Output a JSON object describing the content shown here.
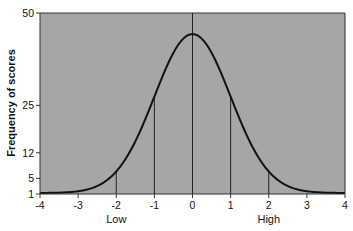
{
  "chart_data": {
    "type": "line",
    "title": "",
    "xlabel": "",
    "ylabel": "Frequency of scores",
    "xlim": [
      -4,
      4
    ],
    "ylim": [
      1,
      50
    ],
    "x_ticks": [
      -4,
      -3,
      -2,
      -1,
      0,
      1,
      2,
      3,
      4
    ],
    "y_ticks": [
      1,
      5,
      12,
      25,
      50
    ],
    "x_annotations": [
      {
        "x": -2,
        "label": "Low"
      },
      {
        "x": 2,
        "label": "High"
      }
    ],
    "vertical_lines": [
      -2,
      -1,
      0,
      1,
      2
    ],
    "grid": false,
    "legend": null,
    "background": "#a6a6a6",
    "line_color": "#111111",
    "series": [
      {
        "name": "Normal distribution",
        "x": [
          -4,
          -3.5,
          -3,
          -2.5,
          -2,
          -1.5,
          -1,
          -0.5,
          0,
          0.5,
          1,
          1.5,
          2,
          2.5,
          3,
          3.5,
          4
        ],
        "values": [
          1.0,
          1.1,
          1.5,
          2.9,
          6.9,
          14.1,
          27.4,
          39.4,
          44.5,
          39.4,
          27.4,
          14.1,
          6.9,
          2.9,
          1.5,
          1.1,
          1.0
        ]
      }
    ],
    "curve_params": {
      "mean": 0,
      "sd": 1,
      "peak": 44.5,
      "baseline": 1
    }
  }
}
